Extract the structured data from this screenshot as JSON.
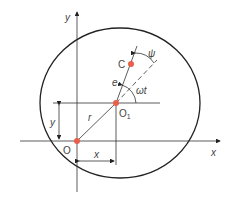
{
  "diagram": {
    "labels": {
      "y_axis": "y",
      "x_axis": "x",
      "origin": "O",
      "center": "O",
      "center_sub": "1",
      "point_c": "C",
      "eccentricity": "e",
      "radius_r": "r",
      "angle_wt": "ωt",
      "angle_psi": "ψ",
      "dim_x": "x",
      "dim_y": "y"
    },
    "colors": {
      "line": "#222222",
      "point": "#e8604c",
      "text": "#444444"
    }
  }
}
